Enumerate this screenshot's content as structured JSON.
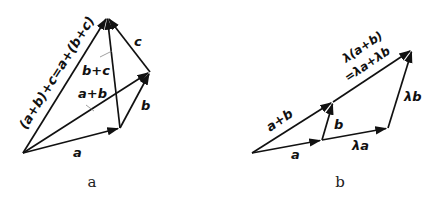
{
  "figures": [
    {
      "id": "a",
      "caption": "a",
      "points": {
        "O": [
          23,
          153
        ],
        "A": [
          120,
          128
        ],
        "B": [
          150,
          72
        ],
        "C": [
          107,
          17
        ]
      },
      "vectors": [
        {
          "name": "a",
          "from": "O",
          "to": "A",
          "label": "a"
        },
        {
          "name": "b",
          "from": "A",
          "to": "B",
          "label": "b"
        },
        {
          "name": "c",
          "from": "B",
          "to": "C",
          "label": "c"
        },
        {
          "name": "a_plus_b",
          "from": "O",
          "to": "B",
          "label": "a+b"
        },
        {
          "name": "b_plus_c",
          "from": "A",
          "to": "C",
          "label": "b+c"
        },
        {
          "name": "sum",
          "from": "O",
          "to": "C",
          "label": "(a+b)+c=a+(b+c)"
        }
      ]
    },
    {
      "id": "b",
      "caption": "b",
      "points": {
        "O": [
          252,
          153
        ],
        "A": [
          322,
          140
        ],
        "LA": [
          388,
          128
        ],
        "B": [
          333,
          102
        ],
        "LB": [
          412,
          50
        ]
      },
      "vectors": [
        {
          "name": "a",
          "from": "O",
          "to": "A",
          "label": "a"
        },
        {
          "name": "lambda_a",
          "from": "A",
          "to": "LA",
          "label": "λa"
        },
        {
          "name": "b",
          "from": "A",
          "to": "B",
          "label": "b"
        },
        {
          "name": "lambda_b",
          "from": "LA",
          "to": "LB",
          "label": "λb"
        },
        {
          "name": "a_plus_b",
          "from": "O",
          "to": "B",
          "label": "a+b"
        },
        {
          "name": "lambda_sum",
          "from": "B",
          "to": "LB",
          "label_line1": "λ(a+b)",
          "label_line2": "=λa+λb"
        }
      ]
    }
  ],
  "labels": {
    "fig_a": {
      "a": "a",
      "b": "b",
      "c": "c",
      "a_plus_b": "a+b",
      "b_plus_c": "b+c",
      "sum": "(a+b)+c=a+(b+c)",
      "caption": "a"
    },
    "fig_b": {
      "a": "a",
      "lambda_a": "λa",
      "b": "b",
      "lambda_b": "λb",
      "a_plus_b": "a+b",
      "lambda_sum_1": "λ(a+b)",
      "lambda_sum_2": "=λa+λb",
      "caption": "b"
    }
  }
}
